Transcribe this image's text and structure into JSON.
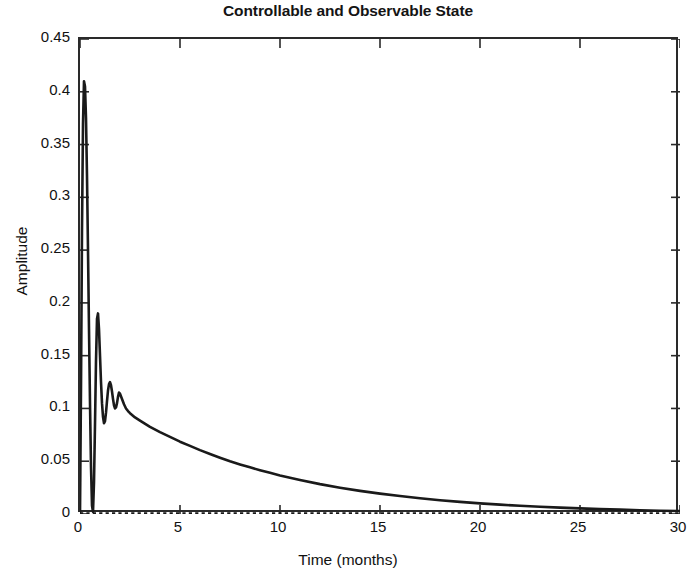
{
  "chart_data": {
    "type": "line",
    "title": "Controllable and Observable State",
    "xlabel": "Time (months)",
    "ylabel": "Amplitude",
    "xlim": [
      0,
      30
    ],
    "ylim": [
      0,
      0.45
    ],
    "xticks": [
      "0",
      "5",
      "10",
      "15",
      "20",
      "25",
      "30"
    ],
    "xtick_values": [
      0,
      5,
      10,
      15,
      20,
      25,
      30
    ],
    "yticks": [
      "0",
      "0.05",
      "0.1",
      "0.15",
      "0.2",
      "0.25",
      "0.3",
      "0.35",
      "0.4",
      "0.45"
    ],
    "ytick_values": [
      0,
      0.05,
      0.1,
      0.15,
      0.2,
      0.25,
      0.3,
      0.35,
      0.4,
      0.45
    ],
    "grid": false,
    "legend": null,
    "series": [
      {
        "name": "state-response",
        "style": "solid",
        "color": "#1a1a1a",
        "x": [
          0,
          0.05,
          0.1,
          0.15,
          0.2,
          0.25,
          0.3,
          0.35,
          0.4,
          0.45,
          0.5,
          0.55,
          0.6,
          0.65,
          0.7,
          0.75,
          0.8,
          0.85,
          0.9,
          0.95,
          1.0,
          1.05,
          1.1,
          1.15,
          1.2,
          1.25,
          1.3,
          1.35,
          1.4,
          1.45,
          1.5,
          1.55,
          1.6,
          1.65,
          1.7,
          1.75,
          1.8,
          1.85,
          1.9,
          1.95,
          2.0,
          2.1,
          2.2,
          2.3,
          2.4,
          2.5,
          2.75,
          3.0,
          3.5,
          4.0,
          4.5,
          5.0,
          5.5,
          6.0,
          6.5,
          7.0,
          7.5,
          8.0,
          8.5,
          9.0,
          9.5,
          10.0,
          11.0,
          12.0,
          13.0,
          14.0,
          15.0,
          16.0,
          17.0,
          18.0,
          19.0,
          20.0,
          21.0,
          22.0,
          23.0,
          24.0,
          25.0,
          26.0,
          27.0,
          28.0,
          29.0,
          30.0
        ],
        "y": [
          0.0,
          0.12,
          0.27,
          0.37,
          0.41,
          0.405,
          0.375,
          0.32,
          0.25,
          0.175,
          0.105,
          0.045,
          0.008,
          0.002,
          0.03,
          0.085,
          0.145,
          0.185,
          0.19,
          0.175,
          0.15,
          0.125,
          0.105,
          0.092,
          0.086,
          0.088,
          0.096,
          0.107,
          0.117,
          0.123,
          0.125,
          0.122,
          0.116,
          0.109,
          0.103,
          0.1,
          0.101,
          0.105,
          0.111,
          0.115,
          0.114,
          0.109,
          0.104,
          0.1,
          0.0975,
          0.0955,
          0.0915,
          0.0885,
          0.0825,
          0.0775,
          0.073,
          0.0685,
          0.0645,
          0.0605,
          0.0568,
          0.0533,
          0.05,
          0.047,
          0.0442,
          0.0415,
          0.039,
          0.0365,
          0.0322,
          0.0283,
          0.0249,
          0.0219,
          0.0193,
          0.017,
          0.0149,
          0.0131,
          0.0115,
          0.0101,
          0.0089,
          0.0078,
          0.0068,
          0.006,
          0.0053,
          0.0046,
          0.0041,
          0.0036,
          0.0031,
          0.0028
        ]
      },
      {
        "name": "zero-baseline",
        "style": "dotted",
        "color": "#1a1a1a",
        "x": [
          0,
          30
        ],
        "y": [
          0,
          0
        ]
      }
    ]
  }
}
